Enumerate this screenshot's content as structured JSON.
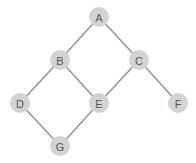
{
  "graph": {
    "nodes": [
      {
        "id": "A",
        "label": "A"
      },
      {
        "id": "B",
        "label": "B"
      },
      {
        "id": "C",
        "label": "C"
      },
      {
        "id": "D",
        "label": "D"
      },
      {
        "id": "E",
        "label": "E"
      },
      {
        "id": "F",
        "label": "F"
      },
      {
        "id": "G",
        "label": "G"
      }
    ],
    "edges": [
      [
        "A",
        "B"
      ],
      [
        "A",
        "C"
      ],
      [
        "B",
        "D"
      ],
      [
        "B",
        "E"
      ],
      [
        "C",
        "E"
      ],
      [
        "C",
        "F"
      ],
      [
        "D",
        "G"
      ],
      [
        "E",
        "G"
      ]
    ],
    "colors": {
      "node_fill": "#d3d3d3",
      "edge": "#8a8a8a",
      "label": "#555555"
    }
  }
}
